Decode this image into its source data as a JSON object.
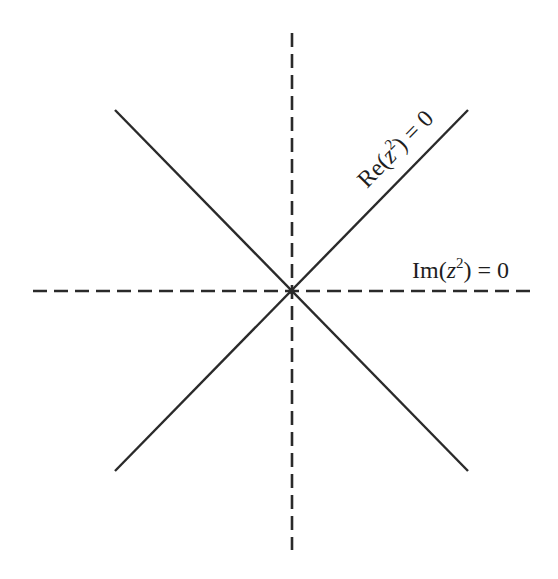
{
  "diagram": {
    "title": "",
    "center": {
      "x": 291.5,
      "y": 291
    },
    "colors": {
      "line": "#2a2a2a",
      "text": "#1e1e1e",
      "background": "#ffffff"
    },
    "axes": [
      {
        "name": "horizontal-dashed-axis",
        "style": "dashed",
        "x1": 33,
        "y1": 291,
        "x2": 537,
        "y2": 291
      },
      {
        "name": "vertical-dashed-axis",
        "style": "dashed",
        "x1": 292,
        "y1": 33,
        "x2": 292,
        "y2": 550
      }
    ],
    "diagonals": [
      {
        "name": "diagonal-ascending",
        "style": "solid",
        "x1": 115,
        "y1": 471,
        "x2": 468,
        "y2": 110
      },
      {
        "name": "diagonal-descending",
        "style": "solid",
        "x1": 115,
        "y1": 110,
        "x2": 468,
        "y2": 471
      }
    ],
    "labels": {
      "re_label": {
        "prefix": "Re(",
        "var": "z",
        "exp": "2",
        "suffix": ") = 0",
        "full": "Re(z²) = 0"
      },
      "im_label": {
        "prefix": "Im(",
        "var": "z",
        "exp": "2",
        "suffix": ") = 0",
        "full": "Im(z²) = 0"
      }
    }
  }
}
